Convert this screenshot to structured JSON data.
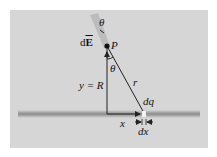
{
  "diagram": {
    "labels": {
      "theta_top": "θ",
      "dE_prefix": "d",
      "dE_vector": "E",
      "point": "P",
      "theta_mid": "θ",
      "y_eq": "y = R",
      "r": "r",
      "dq": "dq",
      "x": "x",
      "dx": "dx"
    },
    "colors": {
      "background": "#d6d6d6",
      "line": "#222222",
      "axis_band": "#8c8c8c",
      "field_vector": "#bdbdbd",
      "charge_element": "#f2f2f2"
    }
  }
}
